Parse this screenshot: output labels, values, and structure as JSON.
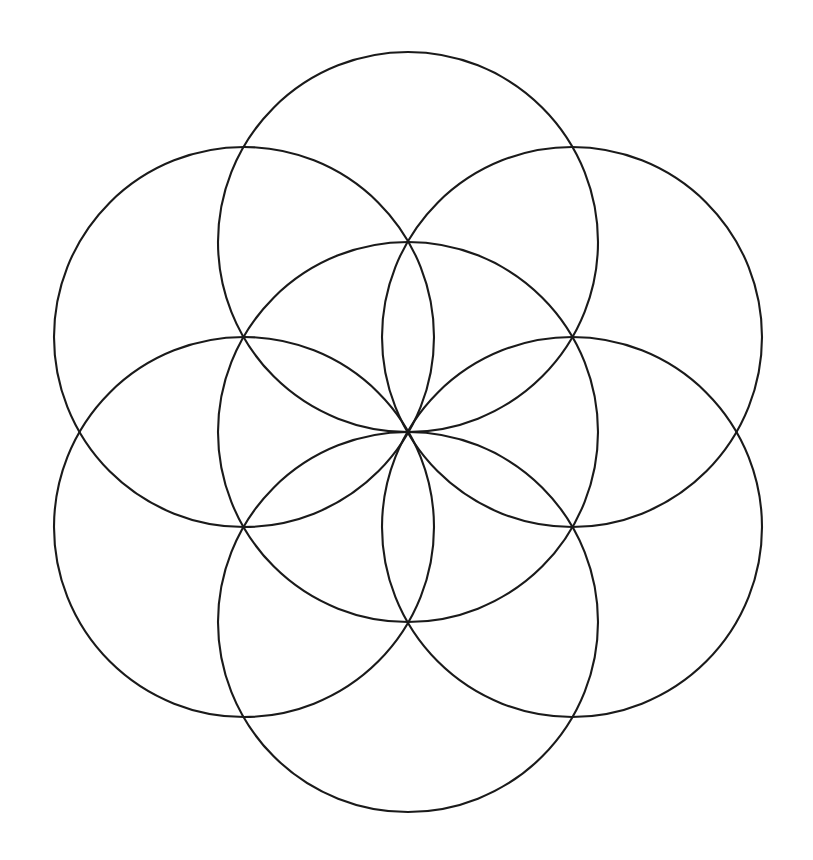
{
  "document": {
    "title": "Seed of Life",
    "type": "line-drawing",
    "description": "Seed of Life sacred geometry pattern: seven overlapping circles of equal radius forming a six-petal rosette",
    "background_color": "#ffffff",
    "stroke_color": "#1a1a1a",
    "stroke_width": 2.1,
    "canvas": {
      "width": 813,
      "height": 860
    }
  },
  "chart_data": {
    "type": "scatter",
    "xlabel": "",
    "ylabel": "",
    "xlim": [
      0,
      813
    ],
    "ylim": [
      0,
      860
    ],
    "grid": false,
    "legend": "none",
    "geometry": {
      "shape": "circle",
      "count": 7,
      "radius": 190,
      "center_x": 408,
      "center_y": 432,
      "angular_step_deg": 60,
      "petals": 6,
      "intersection_nodes": 6
    },
    "categories": [
      "center",
      "top",
      "upper-right",
      "lower-right",
      "bottom",
      "lower-left",
      "upper-left"
    ],
    "circles": [
      {
        "name": "center",
        "cx": 408,
        "cy": 432,
        "r": 190,
        "angle_deg": null
      },
      {
        "name": "top",
        "cx": 408,
        "cy": 242,
        "r": 190,
        "angle_deg": 90
      },
      {
        "name": "upper-right",
        "cx": 572,
        "cy": 337,
        "r": 190,
        "angle_deg": 30
      },
      {
        "name": "lower-right",
        "cx": 572,
        "cy": 527,
        "r": 190,
        "angle_deg": -30
      },
      {
        "name": "bottom",
        "cx": 408,
        "cy": 622,
        "r": 190,
        "angle_deg": -90
      },
      {
        "name": "lower-left",
        "cx": 244,
        "cy": 527,
        "r": 190,
        "angle_deg": -150
      },
      {
        "name": "upper-left",
        "cx": 244,
        "cy": 337,
        "r": 190,
        "angle_deg": 150
      }
    ],
    "bounding_box": {
      "left": 54,
      "top": 52,
      "right": 762,
      "bottom": 812
    }
  }
}
